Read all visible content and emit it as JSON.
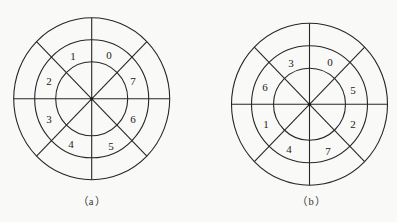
{
  "figure": {
    "style": {
      "line_color": "#262626",
      "background": "#f9f9f8"
    },
    "diagrams": [
      {
        "id": "a",
        "caption": "（a）",
        "center": [
          91.7,
          98.8
        ],
        "rings": {
          "outer": [
            78,
            81
          ],
          "middle": [
            57,
            59
          ],
          "inner": [
            36,
            37
          ]
        },
        "sectors": [
          {
            "label": "1",
            "pos": [
              73,
              56
            ]
          },
          {
            "label": "0",
            "pos": [
              109,
              55
            ]
          },
          {
            "label": "7",
            "pos": [
              133,
              81
            ]
          },
          {
            "label": "6",
            "pos": [
              133,
              119
            ]
          },
          {
            "label": "5",
            "pos": [
              111,
              146
            ]
          },
          {
            "label": "4",
            "pos": [
              71,
              144
            ]
          },
          {
            "label": "3",
            "pos": [
              49,
              119
            ]
          },
          {
            "label": "2",
            "pos": [
              49,
              81
            ]
          }
        ],
        "caption_pos": [
          91.7,
          201.5
        ]
      },
      {
        "id": "b",
        "caption": "（b）",
        "center": [
          309.5,
          104.3
        ],
        "rings": {
          "outer": [
            78,
            81
          ],
          "middle": [
            58,
            58.5
          ],
          "inner": [
            36,
            36
          ]
        },
        "sectors": [
          {
            "label": "3",
            "pos": [
              291,
              63
            ]
          },
          {
            "label": "0",
            "pos": [
              330,
              62
            ]
          },
          {
            "label": "5",
            "pos": [
              353,
              90
            ]
          },
          {
            "label": "2",
            "pos": [
              353,
              124
            ]
          },
          {
            "label": "7",
            "pos": [
              328,
              151
            ]
          },
          {
            "label": "4",
            "pos": [
              289,
              149
            ]
          },
          {
            "label": "1",
            "pos": [
              266,
              124
            ]
          },
          {
            "label": "6",
            "pos": [
              265,
              87
            ]
          }
        ],
        "caption_pos": [
          311.5,
          201.5
        ]
      }
    ]
  }
}
